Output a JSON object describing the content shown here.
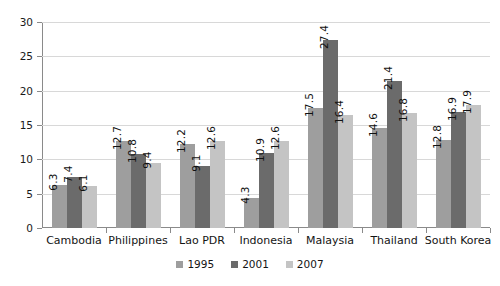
{
  "chart_data": {
    "type": "bar",
    "title": "",
    "subtitle": "",
    "xlabel": "",
    "ylabel": "",
    "ylim": [
      0,
      30
    ],
    "yticks": [
      "0",
      "5",
      "10",
      "15",
      "20",
      "25",
      "30"
    ],
    "ytick_values": [
      0,
      5,
      10,
      15,
      20,
      25,
      30
    ],
    "grid": true,
    "legend_position": "bottom-center",
    "categories": [
      "Cambodia",
      "Philippines",
      "Lao PDR",
      "Indonesia",
      "Malaysia",
      "Thailand",
      "South Korea"
    ],
    "series": [
      {
        "name": "1995",
        "color": "#9e9e9e",
        "values": [
          6.3,
          12.7,
          12.2,
          4.3,
          17.5,
          14.6,
          12.8
        ]
      },
      {
        "name": "2001",
        "color": "#6b6b6b",
        "values": [
          7.4,
          10.8,
          9.1,
          10.9,
          27.4,
          21.4,
          16.9
        ]
      },
      {
        "name": "2007",
        "color": "#c4c4c4",
        "values": [
          6.1,
          9.4,
          12.6,
          12.6,
          16.4,
          16.8,
          17.9
        ]
      }
    ],
    "data_labels": [
      [
        "6.3",
        "7.4",
        "6.1"
      ],
      [
        "12.7",
        "10.8",
        "9.4"
      ],
      [
        "12.2",
        "9.1",
        "12.6"
      ],
      [
        "4.3",
        "10.9",
        "12.6"
      ],
      [
        "17.5",
        "27.4",
        "16.4"
      ],
      [
        "14.6",
        "21.4",
        "16.8"
      ],
      [
        "12.8",
        "16.9",
        "17.9"
      ]
    ]
  },
  "colors": {
    "axis": "#8a8a8a",
    "grid": "#d8d8d8",
    "text": "#141414",
    "background": "#ffffff"
  }
}
